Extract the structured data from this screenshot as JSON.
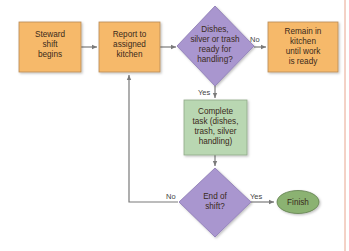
{
  "diagram": {
    "type": "flowchart",
    "colors": {
      "process_fill": "#f6b96b",
      "process_stroke": "#b88a55",
      "decision_fill": "#a996cf",
      "decision_stroke": "#8a78b2",
      "task_fill": "#b9d7b2",
      "task_stroke": "#8fa888",
      "terminal_fill": "#8bb272",
      "terminal_stroke": "#5f7e4c",
      "connector": "#7a7a7a",
      "margin_line": "#e8a48e"
    },
    "nodes": {
      "steward_start": {
        "lines": [
          "Steward",
          "shift",
          "begins"
        ]
      },
      "report_kitchen": {
        "lines": [
          "Report to",
          "assigned",
          "kitchen"
        ]
      },
      "ready_decision": {
        "lines": [
          "Dishes,",
          "silver or trash",
          "ready for",
          "handling?"
        ]
      },
      "remain_kitchen": {
        "lines": [
          "Remain in",
          "kitchen",
          "until work",
          "is ready"
        ]
      },
      "complete_task": {
        "lines": [
          "Complete",
          "task (dishes,",
          "trash, silver",
          "handling)"
        ]
      },
      "end_decision": {
        "lines": [
          "End of",
          "shift?"
        ]
      },
      "finish": {
        "lines": [
          "Finish"
        ]
      }
    },
    "edges": [
      {
        "from": "steward_start",
        "to": "report_kitchen",
        "label": ""
      },
      {
        "from": "report_kitchen",
        "to": "ready_decision",
        "label": ""
      },
      {
        "from": "ready_decision",
        "to": "remain_kitchen",
        "label": "No"
      },
      {
        "from": "ready_decision",
        "to": "complete_task",
        "label": "Yes"
      },
      {
        "from": "complete_task",
        "to": "end_decision",
        "label": ""
      },
      {
        "from": "end_decision",
        "to": "finish",
        "label": "Yes"
      },
      {
        "from": "end_decision",
        "to": "report_kitchen",
        "label": "No"
      }
    ],
    "labels": {
      "no_right": "No",
      "yes_down": "Yes",
      "no_left": "No",
      "yes_right": "Yes"
    }
  }
}
